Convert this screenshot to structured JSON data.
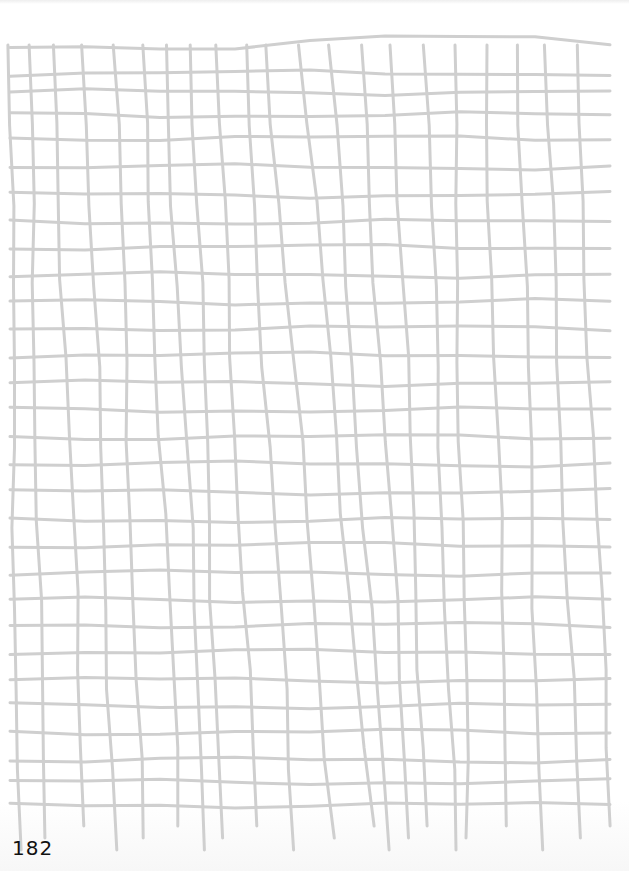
{
  "page": {
    "number": "182",
    "background_color": "#ffffff",
    "ink_color": "#111111"
  },
  "grid": {
    "line_color": "#cfcfcf",
    "line_width": 3,
    "columns_x_top": [
      10,
      29,
      53,
      84,
      115,
      141,
      165,
      191,
      215,
      244,
      266,
      301,
      329,
      361,
      392,
      425,
      453,
      485,
      518,
      544,
      575,
      604
    ],
    "columns_x_bottom": [
      18,
      44,
      85,
      116,
      142,
      180,
      207,
      222,
      256,
      295,
      334,
      371,
      388,
      410,
      427,
      455,
      468,
      509,
      542,
      579,
      611
    ],
    "top_y": 45,
    "bottom_y": 800,
    "tail_bottom_y": 850,
    "rows_y": [
      45,
      73,
      92,
      115,
      138,
      167,
      195,
      222,
      247,
      275,
      302,
      328,
      355,
      383,
      410,
      437,
      464,
      492,
      520,
      545,
      573,
      600,
      625,
      652,
      680,
      706,
      732,
      760,
      782,
      805
    ],
    "left_x": 10,
    "right_x": 610
  }
}
